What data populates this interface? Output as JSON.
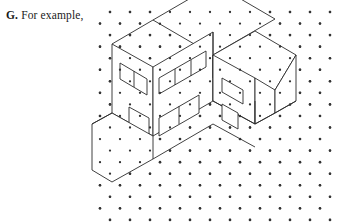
{
  "caption": {
    "label": "G.",
    "text": "For example,"
  },
  "colors": {
    "background": "#ffffff",
    "ink": "#1a1a1a",
    "line": "#2b2b2b",
    "dot": "#333333"
  },
  "figure": {
    "name": "isometric-dot-grid-building-drawing",
    "grid": {
      "type": "isometric-dot-lattice",
      "origin_x": 100,
      "origin_y": 12,
      "column_spacing": 20,
      "row_spacing": 11.55,
      "row_offset": 10,
      "columns": 13,
      "rows": 19,
      "dot_radius": 1.3
    },
    "shapes": [
      {
        "name": "roof-top-face",
        "kind": "polygon",
        "points": "153,20 213,55 275,19 215,-16"
      },
      {
        "name": "main-block-front-left-wall",
        "kind": "polygon",
        "points": "112,44 112,113 153,136 153,67"
      },
      {
        "name": "main-block-front-right-wall",
        "kind": "polygon",
        "points": "153,67 153,136 213,101 213,32"
      },
      {
        "name": "roof-left-edge",
        "kind": "polyline",
        "points": "112,44 153,20"
      },
      {
        "name": "roof-right-ridge",
        "kind": "polyline",
        "points": "213,55 213,101"
      },
      {
        "name": "window-band-left",
        "kind": "polygon",
        "points": "120,63 120,79 147,95 147,79"
      },
      {
        "name": "window-band-left-mullion",
        "kind": "polyline",
        "points": "134,71 134,87"
      },
      {
        "name": "window-band-right",
        "kind": "polygon",
        "points": "159,78 159,94 206,67 206,51"
      },
      {
        "name": "window-band-right-mullion-a",
        "kind": "polyline",
        "points": "175,69 175,85"
      },
      {
        "name": "window-band-right-mullion-b",
        "kind": "polyline",
        "points": "191,60 191,76"
      },
      {
        "name": "lower-opening-left",
        "kind": "polygon",
        "points": "129,107 129,125 149,136 149,118"
      },
      {
        "name": "lower-opening-right",
        "kind": "polygon",
        "points": "159,118 159,136 199,113 199,95"
      },
      {
        "name": "lower-opening-right-mullion",
        "kind": "polyline",
        "points": "179,106 179,124"
      },
      {
        "name": "base-hexagon",
        "kind": "polygon",
        "points": "112,113 153,136 153,159 112,182 92,170 92,124"
      },
      {
        "name": "base-hexagon-alt-edge",
        "kind": "polyline",
        "points": "112,113 92,124"
      },
      {
        "name": "ground-plate-right",
        "kind": "polyline",
        "points": "153,159 213,124 255,147"
      },
      {
        "name": "wing-top-face",
        "kind": "polygon",
        "points": "213,55 255,31 296,55 275,90 255,101 213,78"
      },
      {
        "name": "wing-front-left-wall",
        "kind": "polygon",
        "points": "213,55 213,101 255,124 255,78"
      },
      {
        "name": "wing-chamfer-face",
        "kind": "polygon",
        "points": "255,78 255,124 275,113 275,90"
      },
      {
        "name": "wing-right-face",
        "kind": "polygon",
        "points": "275,90 275,113 296,101 296,55"
      },
      {
        "name": "wing-bottom-edge",
        "kind": "polyline",
        "points": "213,101 255,124 275,113 296,101"
      },
      {
        "name": "wing-window",
        "kind": "polygon",
        "points": "222,78 222,92 243,104 243,90"
      },
      {
        "name": "wing-lower-opening",
        "kind": "polygon",
        "points": "222,104 222,120 238,129 238,113"
      },
      {
        "name": "connector-edge-upper",
        "kind": "polyline",
        "points": "213,32 213,55"
      },
      {
        "name": "connector-edge-lower",
        "kind": "polyline",
        "points": "255,101 255,124"
      }
    ]
  }
}
